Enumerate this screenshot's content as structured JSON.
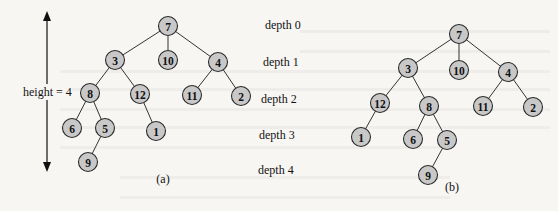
{
  "figure": {
    "height_label": "height = 4",
    "depth_labels": [
      "depth 0",
      "depth 1",
      "depth 2",
      "depth 3",
      "depth 4"
    ],
    "colors": {
      "node_fill": "#c8c8c8",
      "node_stroke": "#2a2a2a",
      "edge": "#333333",
      "background": "#f7f6f3"
    },
    "trees": [
      {
        "caption": "(a)",
        "nodes": [
          {
            "id": "7",
            "x": 168,
            "y": 26
          },
          {
            "id": "3",
            "x": 115,
            "y": 60
          },
          {
            "id": "10",
            "x": 168,
            "y": 60
          },
          {
            "id": "4",
            "x": 218,
            "y": 62
          },
          {
            "id": "8",
            "x": 90,
            "y": 93
          },
          {
            "id": "12",
            "x": 140,
            "y": 94
          },
          {
            "id": "11",
            "x": 192,
            "y": 95
          },
          {
            "id": "2",
            "x": 241,
            "y": 96
          },
          {
            "id": "6",
            "x": 72,
            "y": 128
          },
          {
            "id": "5",
            "x": 105,
            "y": 128
          },
          {
            "id": "1",
            "x": 156,
            "y": 131
          },
          {
            "id": "9",
            "x": 88,
            "y": 162
          }
        ],
        "edges": [
          [
            "7",
            "3"
          ],
          [
            "7",
            "10"
          ],
          [
            "7",
            "4"
          ],
          [
            "3",
            "8"
          ],
          [
            "3",
            "12"
          ],
          [
            "4",
            "11"
          ],
          [
            "4",
            "2"
          ],
          [
            "8",
            "6"
          ],
          [
            "8",
            "5"
          ],
          [
            "12",
            "1"
          ],
          [
            "5",
            "9"
          ]
        ],
        "caption_pos": {
          "x": 163,
          "y": 183
        }
      },
      {
        "caption": "(b)",
        "nodes": [
          {
            "id": "7",
            "x": 459,
            "y": 34
          },
          {
            "id": "3",
            "x": 408,
            "y": 68
          },
          {
            "id": "10",
            "x": 459,
            "y": 70
          },
          {
            "id": "4",
            "x": 508,
            "y": 72
          },
          {
            "id": "12",
            "x": 380,
            "y": 103
          },
          {
            "id": "8",
            "x": 429,
            "y": 106
          },
          {
            "id": "11",
            "x": 483,
            "y": 106
          },
          {
            "id": "2",
            "x": 533,
            "y": 107
          },
          {
            "id": "1",
            "x": 361,
            "y": 137
          },
          {
            "id": "6",
            "x": 413,
            "y": 139
          },
          {
            "id": "5",
            "x": 447,
            "y": 140
          },
          {
            "id": "9",
            "x": 428,
            "y": 175
          }
        ],
        "edges": [
          [
            "7",
            "3"
          ],
          [
            "7",
            "10"
          ],
          [
            "7",
            "4"
          ],
          [
            "3",
            "12"
          ],
          [
            "3",
            "8"
          ],
          [
            "4",
            "11"
          ],
          [
            "4",
            "2"
          ],
          [
            "12",
            "1"
          ],
          [
            "8",
            "6"
          ],
          [
            "8",
            "5"
          ],
          [
            "5",
            "9"
          ]
        ],
        "caption_pos": {
          "x": 452,
          "y": 191
        }
      }
    ]
  }
}
